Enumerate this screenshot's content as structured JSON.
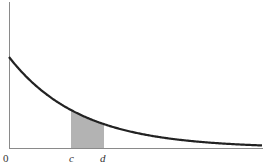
{
  "chart_data": {
    "type": "line",
    "title": "",
    "xlabel": "",
    "ylabel": "",
    "curve": "exponential decay density f(x) = λe^{-λx}",
    "x_tick_labels": [
      "0",
      "c",
      "d"
    ],
    "shaded_region": {
      "from": "c",
      "to": "d",
      "meaning": "area under curve between c and d"
    },
    "series": [
      {
        "name": "density",
        "x_px": [
          9,
          30,
          50,
          71,
          90,
          104,
          130,
          160,
          190,
          220,
          262
        ],
        "height_px": [
          91,
          67,
          51,
          38,
          29,
          26,
          17,
          11,
          7,
          5,
          2
        ]
      }
    ],
    "grid": false,
    "legend": null,
    "colors": {
      "curve": "#222222",
      "axis": "#888888",
      "shade": "#b3b3b3"
    }
  },
  "labels": {
    "origin": "0",
    "c": "c",
    "d": "d"
  }
}
